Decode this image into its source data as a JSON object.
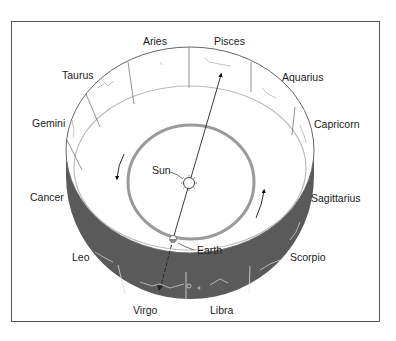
{
  "diagram": {
    "type": "zodiac-band-orbit",
    "colors": {
      "frame": "#555555",
      "dark_band": "#5a5a5a",
      "orbit_ring": "#9a9a9a",
      "line": "#222222"
    },
    "zodiac_labels": [
      {
        "key": "aries",
        "text": "Aries"
      },
      {
        "key": "pisces",
        "text": "Pisces"
      },
      {
        "key": "taurus",
        "text": "Taurus"
      },
      {
        "key": "aquarius",
        "text": "Aquarius"
      },
      {
        "key": "gemini",
        "text": "Gemini"
      },
      {
        "key": "capricorn",
        "text": "Capricorn"
      },
      {
        "key": "cancer",
        "text": "Cancer"
      },
      {
        "key": "sagittarius",
        "text": "Sagittarius"
      },
      {
        "key": "leo",
        "text": "Leo"
      },
      {
        "key": "scorpio",
        "text": "Scorpio"
      },
      {
        "key": "virgo",
        "text": "Virgo"
      },
      {
        "key": "libra",
        "text": "Libra"
      }
    ],
    "bodies": {
      "sun": "Sun",
      "earth": "Earth"
    }
  }
}
